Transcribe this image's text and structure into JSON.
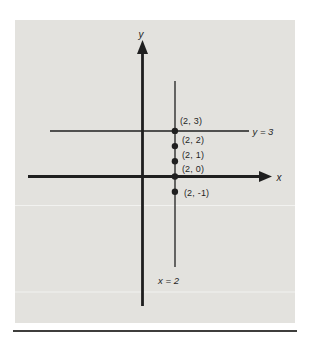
{
  "figure": {
    "y_axis_label": "y",
    "x_axis_label": "x",
    "vertical_line_label": "x = 2",
    "horizontal_line_label": "y = 3",
    "points": [
      {
        "x": 2,
        "y": 3,
        "label": "(2, 3)"
      },
      {
        "x": 2,
        "y": 2,
        "label": "(2, 2)"
      },
      {
        "x": 2,
        "y": 1,
        "label": "(2, 1)"
      },
      {
        "x": 2,
        "y": 0,
        "label": "(2, 0)"
      },
      {
        "x": 2,
        "y": -1,
        "label": "(2, -1)"
      }
    ],
    "colors": {
      "panel": "#e3e2de",
      "ink": "#1f1f1f",
      "rule": "#3f3e3c",
      "background": "#ffffff"
    }
  }
}
